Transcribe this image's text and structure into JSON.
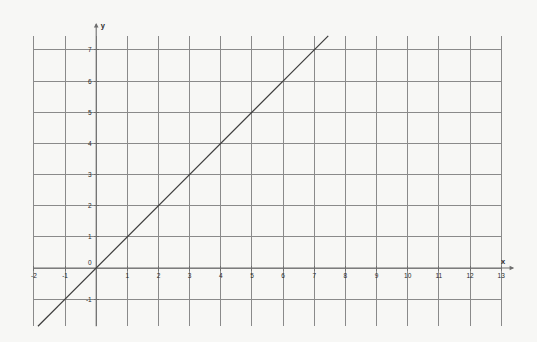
{
  "figure": {
    "background_color": "#f7f7f5",
    "grid_color": "#8a8a8a",
    "axis_color": "#6e6e6e",
    "line_color": "#3d3d3d",
    "text_color": "#2b2b2b"
  },
  "axes": {
    "x_axis_label": "x",
    "y_axis_label": "y",
    "x_tick_labels": [
      "-2",
      "-1",
      "0",
      "1",
      "2",
      "3",
      "4",
      "5",
      "6",
      "7",
      "8",
      "9",
      "10",
      "11",
      "12",
      "13"
    ],
    "y_tick_labels": [
      "7",
      "6",
      "5",
      "4",
      "3",
      "2",
      "1",
      "0",
      "-1"
    ]
  },
  "chart_data": {
    "type": "line",
    "title": "",
    "subtitle": "",
    "xlabel": "x",
    "ylabel": "y",
    "xlim": [
      -2.1,
      13.4
    ],
    "ylim": [
      -2.1,
      7.6
    ],
    "xticks": [
      -2,
      -1,
      0,
      1,
      2,
      3,
      4,
      5,
      6,
      7,
      8,
      9,
      10,
      11,
      12,
      13
    ],
    "yticks": [
      -1,
      0,
      1,
      2,
      3,
      4,
      5,
      6,
      7
    ],
    "xtick_labels": [
      "-2",
      "-1",
      "0",
      "1",
      "2",
      "3",
      "4",
      "5",
      "6",
      "7",
      "8",
      "9",
      "10",
      "11",
      "12",
      "13"
    ],
    "ytick_labels": [
      "-1",
      "0",
      "1",
      "2",
      "3",
      "4",
      "5",
      "6",
      "7"
    ],
    "grid": true,
    "grid_spacing_x": 1,
    "grid_spacing_y": 1,
    "legend": false,
    "legend_position": "none",
    "annotations": [],
    "series": [
      {
        "name": "y = x",
        "equation": "y = x",
        "slope": 1,
        "intercept": 0,
        "x": [
          -2.05,
          13.0
        ],
        "values": [
          -2.05,
          13.0
        ],
        "points_on_grid": [
          {
            "x": 0,
            "y": 0
          },
          {
            "x": 1,
            "y": 1
          },
          {
            "x": 2,
            "y": 2
          },
          {
            "x": 3,
            "y": 3
          },
          {
            "x": 4,
            "y": 4
          },
          {
            "x": 5,
            "y": 5
          },
          {
            "x": 6,
            "y": 6
          },
          {
            "x": 7,
            "y": 7
          }
        ],
        "style": "solid",
        "color": "#3d3d3d",
        "width": 1.2
      }
    ]
  }
}
